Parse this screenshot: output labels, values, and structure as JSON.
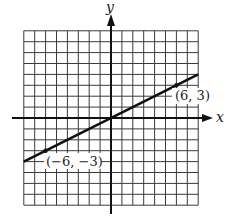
{
  "chart_data": {
    "type": "line",
    "title": "",
    "xlabel": "x",
    "ylabel": "y",
    "xlim": [
      -8,
      8
    ],
    "ylim": [
      -8,
      8
    ],
    "grid": true,
    "grid_step": 1,
    "series": [
      {
        "name": "line through origin",
        "x": [
          -8,
          8
        ],
        "y": [
          -4,
          4
        ],
        "slope": 0.5,
        "intercept": 0
      }
    ],
    "points": [
      {
        "x": -6,
        "y": -3,
        "label": "(−6, −3)"
      },
      {
        "x": 6,
        "y": 3,
        "label": "(6, 3)"
      }
    ]
  },
  "labels": {
    "x_axis": "x",
    "y_axis": "y",
    "point_a": "(−6, −3)",
    "point_b": "(6, 3)"
  },
  "colors": {
    "grid": "#3a3a3a",
    "axis": "#111111",
    "line": "#111111",
    "background": "#ffffff"
  }
}
